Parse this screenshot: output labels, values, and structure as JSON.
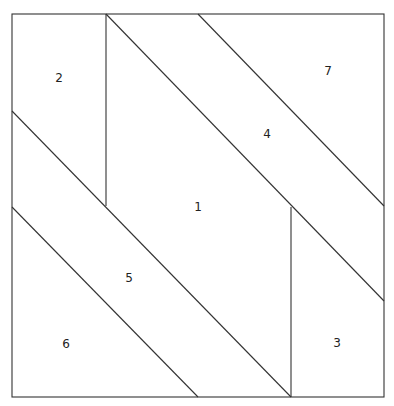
{
  "diagram": {
    "type": "quilt-block-partition",
    "stroke_color": "#333333",
    "background": "#ffffff",
    "frame": {
      "x1": 12,
      "y1": 14,
      "x2": 384,
      "y2": 397
    },
    "lines": [
      {
        "id": "vertical-left",
        "x1": 106,
        "y1": 14,
        "x2": 106,
        "y2": 206
      },
      {
        "id": "vertical-right",
        "x1": 291,
        "y1": 207,
        "x2": 291,
        "y2": 397
      },
      {
        "id": "diagonal-a",
        "x1": 12,
        "y1": 111,
        "x2": 291,
        "y2": 397
      },
      {
        "id": "diagonal-b",
        "x1": 12,
        "y1": 207,
        "x2": 198,
        "y2": 397
      },
      {
        "id": "diagonal-c",
        "x1": 106,
        "y1": 14,
        "x2": 384,
        "y2": 301
      },
      {
        "id": "diagonal-d",
        "x1": 198,
        "y1": 14,
        "x2": 384,
        "y2": 206
      }
    ],
    "regions": [
      {
        "label": "1",
        "x": 198,
        "y": 207
      },
      {
        "label": "2",
        "x": 59,
        "y": 78
      },
      {
        "label": "3",
        "x": 337,
        "y": 343
      },
      {
        "label": "4",
        "x": 267,
        "y": 134
      },
      {
        "label": "5",
        "x": 129,
        "y": 278
      },
      {
        "label": "6",
        "x": 66,
        "y": 344
      },
      {
        "label": "7",
        "x": 328,
        "y": 71
      }
    ]
  }
}
